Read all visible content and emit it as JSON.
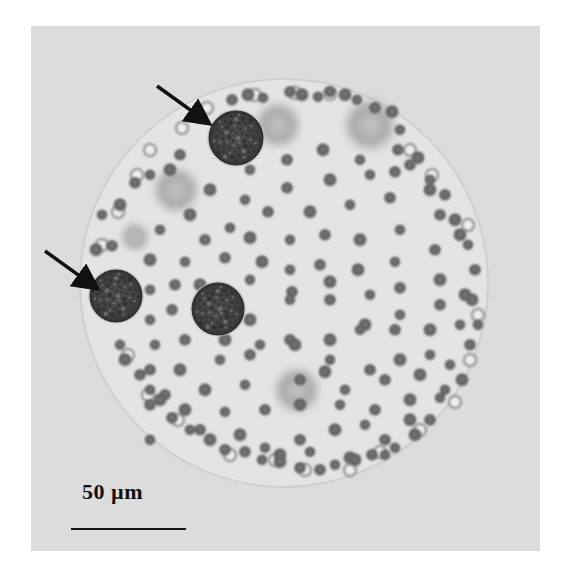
{
  "figure": {
    "type": "light micrograph",
    "frame": {
      "x": 31,
      "y": 26,
      "width": 509,
      "height": 525,
      "background": "#dcdcdc"
    },
    "colony": {
      "cx": 284,
      "cy": 283,
      "r": 204,
      "fill": "#e4e4e4",
      "edge": "#cfcfcf"
    },
    "scale_bar": {
      "label": "50 µm",
      "length_px": 115
    },
    "arrows": [
      {
        "name": "arrow-top",
        "x1": 157,
        "y1": 86,
        "x2": 207,
        "y2": 122
      },
      {
        "name": "arrow-left",
        "x1": 45,
        "y1": 251,
        "x2": 95,
        "y2": 287
      }
    ],
    "large_cells": [
      {
        "name": "gonidium-top",
        "cx": 236,
        "cy": 138,
        "r": 27
      },
      {
        "name": "gonidium-left",
        "cx": 116,
        "cy": 296,
        "r": 26
      },
      {
        "name": "gonidium-center",
        "cx": 218,
        "cy": 309,
        "r": 26
      }
    ],
    "diffuse_patches": [
      {
        "cx": 278,
        "cy": 125,
        "r": 26
      },
      {
        "cx": 370,
        "cy": 125,
        "r": 30
      },
      {
        "cx": 176,
        "cy": 190,
        "r": 26
      },
      {
        "cx": 297,
        "cy": 390,
        "r": 26
      },
      {
        "cx": 135,
        "cy": 237,
        "r": 16
      }
    ],
    "small_cells": [
      [
        250,
        170
      ],
      [
        287,
        160
      ],
      [
        323,
        150
      ],
      [
        360,
        160
      ],
      [
        395,
        172
      ],
      [
        210,
        190
      ],
      [
        245,
        200
      ],
      [
        287,
        188
      ],
      [
        330,
        180
      ],
      [
        370,
        175
      ],
      [
        410,
        165
      ],
      [
        190,
        215
      ],
      [
        230,
        228
      ],
      [
        268,
        212
      ],
      [
        310,
        212
      ],
      [
        350,
        205
      ],
      [
        390,
        198
      ],
      [
        430,
        190
      ],
      [
        160,
        230
      ],
      [
        205,
        240
      ],
      [
        250,
        238
      ],
      [
        290,
        240
      ],
      [
        325,
        235
      ],
      [
        360,
        240
      ],
      [
        400,
        230
      ],
      [
        440,
        215
      ],
      [
        150,
        260
      ],
      [
        185,
        262
      ],
      [
        225,
        258
      ],
      [
        262,
        262
      ],
      [
        290,
        270
      ],
      [
        320,
        265
      ],
      [
        358,
        270
      ],
      [
        395,
        262
      ],
      [
        435,
        250
      ],
      [
        460,
        235
      ],
      [
        150,
        290
      ],
      [
        175,
        285
      ],
      [
        200,
        285
      ],
      [
        250,
        280
      ],
      [
        292,
        292
      ],
      [
        330,
        282
      ],
      [
        370,
        295
      ],
      [
        400,
        288
      ],
      [
        440,
        280
      ],
      [
        150,
        320
      ],
      [
        172,
        310
      ],
      [
        250,
        320
      ],
      [
        290,
        300
      ],
      [
        330,
        300
      ],
      [
        365,
        325
      ],
      [
        400,
        315
      ],
      [
        440,
        305
      ],
      [
        465,
        295
      ],
      [
        155,
        345
      ],
      [
        185,
        340
      ],
      [
        225,
        340
      ],
      [
        260,
        345
      ],
      [
        290,
        340
      ],
      [
        330,
        340
      ],
      [
        360,
        330
      ],
      [
        395,
        330
      ],
      [
        430,
        330
      ],
      [
        460,
        325
      ],
      [
        150,
        370
      ],
      [
        180,
        370
      ],
      [
        220,
        360
      ],
      [
        250,
        355
      ],
      [
        295,
        345
      ],
      [
        330,
        360
      ],
      [
        370,
        370
      ],
      [
        400,
        360
      ],
      [
        430,
        355
      ],
      [
        165,
        395
      ],
      [
        205,
        390
      ],
      [
        245,
        385
      ],
      [
        300,
        380
      ],
      [
        325,
        372
      ],
      [
        345,
        390
      ],
      [
        385,
        380
      ],
      [
        420,
        375
      ],
      [
        450,
        365
      ],
      [
        150,
        405
      ],
      [
        185,
        410
      ],
      [
        225,
        412
      ],
      [
        265,
        410
      ],
      [
        300,
        405
      ],
      [
        340,
        405
      ],
      [
        375,
        410
      ],
      [
        410,
        400
      ],
      [
        445,
        390
      ],
      [
        200,
        430
      ],
      [
        240,
        435
      ],
      [
        265,
        448
      ],
      [
        300,
        440
      ],
      [
        335,
        430
      ],
      [
        365,
        425
      ],
      [
        385,
        440
      ],
      [
        410,
        420
      ],
      [
        150,
        440
      ],
      [
        225,
        450
      ],
      [
        280,
        455
      ],
      [
        310,
        452
      ],
      [
        320,
        470
      ],
      [
        350,
        458
      ],
      [
        385,
        455
      ],
      [
        180,
        155
      ],
      [
        170,
        170
      ],
      [
        150,
        175
      ],
      [
        135,
        183
      ],
      [
        120,
        205
      ],
      [
        102,
        215
      ],
      [
        112,
        246
      ],
      [
        96,
        250
      ],
      [
        200,
        118
      ],
      [
        232,
        100
      ],
      [
        248,
        95
      ],
      [
        263,
        98
      ],
      [
        290,
        92
      ],
      [
        302,
        95
      ],
      [
        318,
        97
      ],
      [
        330,
        92
      ],
      [
        345,
        95
      ],
      [
        357,
        100
      ],
      [
        375,
        108
      ],
      [
        392,
        112
      ],
      [
        400,
        130
      ],
      [
        398,
        150
      ],
      [
        418,
        158
      ],
      [
        430,
        180
      ],
      [
        445,
        195
      ],
      [
        455,
        220
      ],
      [
        468,
        245
      ],
      [
        475,
        270
      ],
      [
        472,
        300
      ],
      [
        478,
        325
      ],
      [
        470,
        345
      ],
      [
        462,
        380
      ],
      [
        440,
        398
      ],
      [
        430,
        420
      ],
      [
        415,
        435
      ],
      [
        395,
        448
      ],
      [
        372,
        455
      ],
      [
        355,
        460
      ],
      [
        335,
        465
      ],
      [
        300,
        468
      ],
      [
        280,
        462
      ],
      [
        262,
        460
      ],
      [
        245,
        452
      ],
      [
        210,
        440
      ],
      [
        190,
        430
      ],
      [
        172,
        418
      ],
      [
        160,
        400
      ],
      [
        150,
        390
      ],
      [
        140,
        375
      ],
      [
        125,
        360
      ],
      [
        120,
        345
      ]
    ],
    "ring_cells_light": [
      [
        207,
        108
      ],
      [
        182,
        128
      ],
      [
        150,
        150
      ],
      [
        137,
        175
      ],
      [
        118,
        212
      ],
      [
        102,
        245
      ],
      [
        255,
        95
      ],
      [
        295,
        93
      ],
      [
        330,
        94
      ],
      [
        410,
        150
      ],
      [
        432,
        175
      ],
      [
        468,
        225
      ],
      [
        478,
        315
      ],
      [
        470,
        360
      ],
      [
        455,
        402
      ],
      [
        420,
        430
      ],
      [
        380,
        452
      ],
      [
        350,
        470
      ],
      [
        305,
        470
      ],
      [
        275,
        460
      ],
      [
        230,
        455
      ],
      [
        178,
        420
      ],
      [
        148,
        395
      ],
      [
        128,
        355
      ]
    ]
  }
}
